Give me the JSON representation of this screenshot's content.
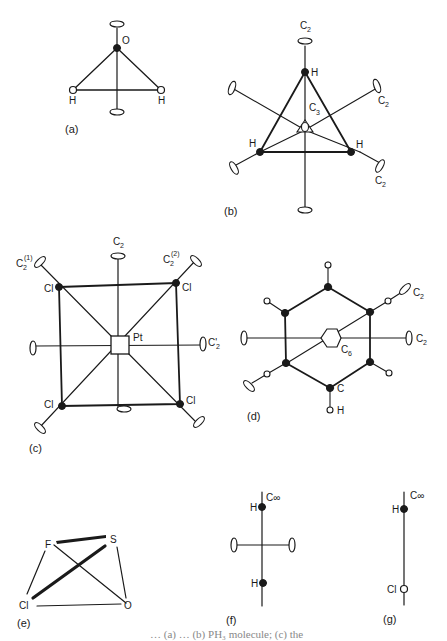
{
  "figure": {
    "panels": [
      {
        "id": "a",
        "caption": "(a)",
        "molecule": "H2O",
        "atoms": [
          "O",
          "H",
          "H"
        ],
        "axes": [
          "C2"
        ]
      },
      {
        "id": "b",
        "caption": "(b)",
        "molecule": "PH3-like (C3 + 3 C2)",
        "atoms": [
          "H",
          "H",
          "H"
        ],
        "axes": [
          "C2",
          "C3",
          "C2",
          "C2"
        ]
      },
      {
        "id": "c",
        "caption": "(c)",
        "molecule": "PtCl4",
        "atoms": [
          "Pt",
          "Cl",
          "Cl",
          "Cl",
          "Cl"
        ],
        "axes": [
          "C2",
          "C2(1)",
          "C2(2)",
          "C2'"
        ]
      },
      {
        "id": "d",
        "caption": "(d)",
        "molecule": "C6H6",
        "atoms": [
          "C",
          "H"
        ],
        "axes": [
          "C6",
          "C2",
          "C2"
        ]
      },
      {
        "id": "e",
        "caption": "(e)",
        "molecule": "SOFCl",
        "atoms": [
          "F",
          "S",
          "Cl",
          "O"
        ],
        "axes": []
      },
      {
        "id": "f",
        "caption": "(f)",
        "molecule": "H2",
        "atoms": [
          "H",
          "H"
        ],
        "axes": [
          "C∞"
        ]
      },
      {
        "id": "g",
        "caption": "(g)",
        "molecule": "HCl",
        "atoms": [
          "H",
          "Cl"
        ],
        "axes": [
          "C∞"
        ]
      }
    ],
    "labels": {
      "a_O": "O",
      "a_H1": "H",
      "a_H2": "H",
      "a_cap": "(a)",
      "b_C2top": "C",
      "b_C2top_sub": "2",
      "b_H_top": "H",
      "b_C3": "C",
      "b_C3_sub": "3",
      "b_H_left": "H",
      "b_H_right": "H",
      "b_C2r1": "C",
      "b_C2r1_sub": "2",
      "b_C2r2": "C",
      "b_C2r2_sub": "2",
      "b_cap": "(b)",
      "c_C2": "C",
      "c_C2_sub": "2",
      "c_C21": "C",
      "c_C21_sub": "2",
      "c_C21_sup": "(1)",
      "c_C22": "C",
      "c_C22_sub": "2",
      "c_C22_sup": "(2)",
      "c_C2p": "C'",
      "c_C2p_sub": "2",
      "c_Pt": "Pt",
      "c_Cl": "Cl",
      "c_cap": "(c)",
      "d_C2a": "C",
      "d_C2a_sub": "2",
      "d_C2b": "C",
      "d_C2b_sub": "2",
      "d_C6": "C",
      "d_C6_sub": "6",
      "d_C": "C",
      "d_H": "H",
      "d_cap": "(d)",
      "e_F": "F",
      "e_S": "S",
      "e_Cl": "Cl",
      "e_O": "O",
      "e_cap": "(e)",
      "f_Cinf": "C∞",
      "f_H": "H",
      "f_cap": "(f)",
      "g_Cinf": "C∞",
      "g_H": "H",
      "g_Cl": "Cl",
      "g_cap": "(g)"
    },
    "caption_partial": "…  (a)  …  (b) PH₃ molecule; (c) the"
  }
}
